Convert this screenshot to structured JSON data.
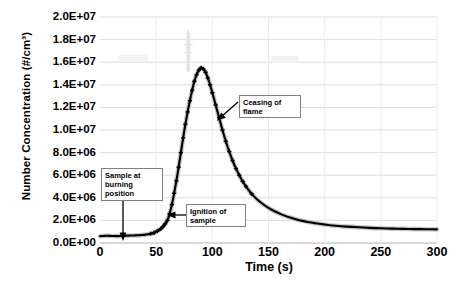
{
  "chart_data": {
    "type": "line",
    "title": "",
    "xlabel": "Time (s)",
    "ylabel": "Number Concentration (#/cm³)",
    "xlim": [
      0,
      300
    ],
    "ylim": [
      0,
      20000000
    ],
    "xticks": [
      0,
      50,
      100,
      150,
      200,
      250,
      300
    ],
    "xtick_labels": [
      "0",
      "50",
      "100",
      "150",
      "200",
      "250",
      "300"
    ],
    "yticks": [
      0,
      2000000,
      4000000,
      6000000,
      8000000,
      10000000,
      12000000,
      14000000,
      16000000,
      18000000,
      20000000
    ],
    "ytick_labels": [
      "0.0E+00",
      "2.0E+06",
      "4.0E+06",
      "6.0E+06",
      "8.0E+06",
      "1.0E+07",
      "1.2E+07",
      "1.4E+07",
      "1.6E+07",
      "1.8E+07",
      "2.0E+07"
    ],
    "grid": "horizontal-and-vertical",
    "legend": "none",
    "marker": "plus",
    "line_color": "#000000",
    "grid_color": "#d9d9d9",
    "background_color": "#ffffff",
    "series": [
      {
        "name": "Number Concentration",
        "x": [
          0,
          3,
          6,
          9,
          12,
          15,
          18,
          21,
          24,
          27,
          30,
          33,
          36,
          39,
          42,
          45,
          48,
          51,
          54,
          56,
          58,
          60,
          62,
          64,
          66,
          68,
          70,
          72,
          74,
          76,
          78,
          80,
          82,
          84,
          86,
          88,
          90,
          92,
          94,
          96,
          98,
          100,
          103,
          106,
          109,
          112,
          115,
          118,
          121,
          124,
          127,
          130,
          135,
          140,
          145,
          150,
          155,
          160,
          165,
          170,
          175,
          180,
          185,
          190,
          195,
          200,
          210,
          220,
          230,
          240,
          250,
          260,
          270,
          280,
          290,
          300
        ],
        "y": [
          600000,
          620000,
          640000,
          630000,
          620000,
          610000,
          620000,
          640000,
          650000,
          660000,
          660000,
          680000,
          700000,
          720000,
          760000,
          820000,
          900000,
          1050000,
          1250000,
          1450000,
          1700000,
          2000000,
          2600000,
          3400000,
          4400000,
          5500000,
          6700000,
          8000000,
          9300000,
          10500000,
          11600000,
          12600000,
          13500000,
          14300000,
          14900000,
          15300000,
          15500000,
          15400000,
          15100000,
          14600000,
          14000000,
          13300000,
          12200000,
          11100000,
          10000000,
          9000000,
          8100000,
          7300000,
          6600000,
          6000000,
          5450000,
          5000000,
          4350000,
          3850000,
          3450000,
          3100000,
          2830000,
          2600000,
          2400000,
          2230000,
          2080000,
          1960000,
          1860000,
          1780000,
          1700000,
          1640000,
          1530000,
          1450000,
          1390000,
          1340000,
          1300000,
          1270000,
          1250000,
          1230000,
          1220000,
          1210000
        ]
      }
    ],
    "annotations": [
      {
        "id": "sample-at-burning-position",
        "text": "Sample at burning position",
        "lines": [
          "Sample at",
          "burning",
          "position"
        ],
        "points_to_x": 20,
        "points_to_y": 1200000,
        "arrow": "down"
      },
      {
        "id": "ignition-of-sample",
        "text": "Ignition of sample",
        "lines": [
          "Ignition of",
          "sample"
        ],
        "points_to_x": 58,
        "points_to_y": 1700000,
        "arrow": "left"
      },
      {
        "id": "ceasing-of-flame",
        "text": "Ceasing of flame",
        "lines": [
          "Ceasing of",
          "flame"
        ],
        "points_to_x": 103,
        "points_to_y": 11500000,
        "arrow": "down-left"
      }
    ]
  }
}
